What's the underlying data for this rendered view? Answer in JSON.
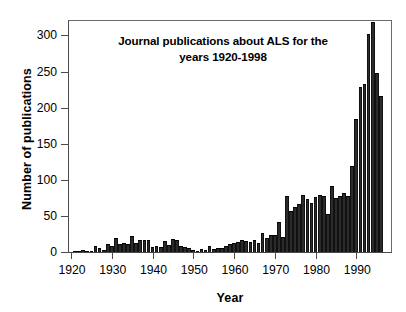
{
  "chart_data": {
    "type": "bar",
    "title": "Journal publications about ALS for the years 1920-1998",
    "title_line1": "Journal publications about ALS for the",
    "title_line2": "years 1920-1998",
    "xlabel": "Year",
    "ylabel": "Number of publications",
    "xlim": [
      1919.5,
      1998.5
    ],
    "ylim": [
      0,
      320
    ],
    "grid": false,
    "legend": null,
    "bar_color": "#2b2b2b",
    "axis_color": "#4a4a4a",
    "ytick_labels": [
      "0",
      "50",
      "100",
      "150",
      "200",
      "250",
      "300"
    ],
    "ytick_values": [
      0,
      50,
      100,
      150,
      200,
      250,
      300
    ],
    "xtick_labels": [
      "1920",
      "1930",
      "1940",
      "1950",
      "1960",
      "1970",
      "1980",
      "1990"
    ],
    "xtick_values": [
      1920,
      1930,
      1940,
      1950,
      1960,
      1970,
      1980,
      1990
    ],
    "categories": [
      1920,
      1921,
      1922,
      1923,
      1924,
      1925,
      1926,
      1927,
      1928,
      1929,
      1930,
      1931,
      1932,
      1933,
      1934,
      1935,
      1936,
      1937,
      1938,
      1939,
      1940,
      1941,
      1942,
      1943,
      1944,
      1945,
      1946,
      1947,
      1948,
      1949,
      1950,
      1951,
      1952,
      1953,
      1954,
      1955,
      1956,
      1957,
      1958,
      1959,
      1960,
      1961,
      1962,
      1963,
      1964,
      1965,
      1966,
      1967,
      1968,
      1969,
      1970,
      1971,
      1972,
      1973,
      1974,
      1975,
      1976,
      1977,
      1978,
      1979,
      1980,
      1981,
      1982,
      1983,
      1984,
      1985,
      1986,
      1987,
      1988,
      1989,
      1990,
      1991,
      1992,
      1993,
      1994,
      1995,
      1996,
      1997,
      1998
    ],
    "values": [
      0,
      1,
      1,
      3,
      2,
      1,
      8,
      5,
      3,
      11,
      9,
      20,
      11,
      12,
      11,
      22,
      13,
      16,
      16,
      16,
      7,
      8,
      7,
      15,
      10,
      18,
      17,
      8,
      7,
      6,
      3,
      2,
      4,
      3,
      9,
      4,
      6,
      5,
      9,
      11,
      12,
      14,
      16,
      15,
      14,
      16,
      13,
      27,
      19,
      23,
      24,
      42,
      21,
      78,
      57,
      62,
      66,
      79,
      74,
      68,
      76,
      79,
      77,
      53,
      92,
      75,
      77,
      82,
      77,
      119,
      104,
      93,
      118,
      178,
      118,
      136,
      130,
      147,
      184
    ],
    "series": [
      {
        "name": "Journal publications about ALS",
        "values": [
          0,
          1,
          1,
          3,
          2,
          1,
          8,
          5,
          3,
          11,
          9,
          20,
          11,
          12,
          11,
          22,
          13,
          16,
          16,
          16,
          7,
          8,
          7,
          15,
          10,
          18,
          17,
          8,
          7,
          6,
          3,
          2,
          4,
          3,
          9,
          4,
          6,
          5,
          9,
          11,
          12,
          14,
          16,
          15,
          14,
          16,
          13,
          27,
          19,
          23,
          24,
          42,
          21,
          78,
          57,
          62,
          66,
          79,
          74,
          68,
          76,
          79,
          77,
          53,
          92,
          75,
          77,
          82,
          77,
          119,
          104,
          93,
          118,
          178,
          118,
          136,
          130,
          147,
          184
        ]
      }
    ]
  },
  "chart_data_tail": {
    "categories": [
      1990,
      1991,
      1992,
      1993,
      1994,
      1995,
      1996,
      1997,
      1998
    ],
    "values": [
      184,
      229,
      233,
      302,
      318,
      248,
      216,
      0,
      0
    ]
  }
}
